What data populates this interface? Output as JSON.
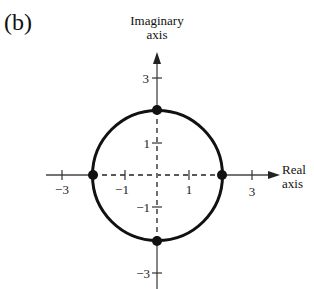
{
  "figure": {
    "panel_label": "(b)",
    "y_axis_label_line1": "Imaginary",
    "y_axis_label_line2": "axis",
    "x_axis_label_line1": "Real",
    "x_axis_label_line2": "axis"
  },
  "x_ticks": [
    {
      "value": -3,
      "label": "−3"
    },
    {
      "value": -1,
      "label": "−1"
    },
    {
      "value": 1,
      "label": "1"
    },
    {
      "value": 3,
      "label": "3"
    }
  ],
  "y_ticks": [
    {
      "value": 3,
      "label": "3"
    },
    {
      "value": 1,
      "label": "1"
    },
    {
      "value": -1,
      "label": "−1"
    },
    {
      "value": -3,
      "label": "−3"
    }
  ],
  "circle": {
    "center": [
      0,
      0
    ],
    "radius": 2
  },
  "points": [
    {
      "name": "top",
      "re": 0,
      "im": 2
    },
    {
      "name": "bottom",
      "re": 0,
      "im": -2
    },
    {
      "name": "left",
      "re": -2,
      "im": 0
    },
    {
      "name": "right",
      "re": 2,
      "im": 0
    }
  ],
  "colors": {
    "ink": "#111111",
    "axis": "#444444",
    "background": "#ffffff"
  }
}
